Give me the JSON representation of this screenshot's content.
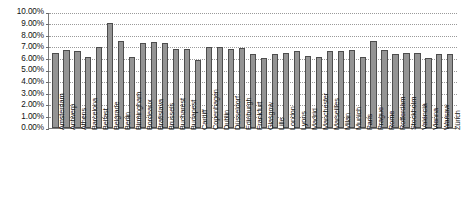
{
  "chart_data": {
    "type": "bar",
    "title": "",
    "subtitle": "",
    "xlabel": "",
    "ylabel": "",
    "ylim": [
      0,
      10
    ],
    "y_unit": "%",
    "grid": true,
    "legend": "none",
    "y_ticks": [
      "0.00%",
      "1.00%",
      "2.00%",
      "3.00%",
      "4.00%",
      "5.00%",
      "6.00%",
      "7.00%",
      "8.00%",
      "9.00%",
      "10.00%"
    ],
    "y_tick_values": [
      0,
      1,
      2,
      3,
      4,
      5,
      6,
      7,
      8,
      9,
      10
    ],
    "categories": [
      "Amsterdam",
      "Antwerp",
      "Athens",
      "Barcelona",
      "Belfast",
      "Belgrade",
      "Berlin",
      "Birmingham",
      "Bordeaux",
      "Bratislava",
      "Brussels",
      "Bucharest",
      "Budapest",
      "Cardiff",
      "Copenhagen",
      "Dublin",
      "Düsseldorf",
      "Edinburgh",
      "Frankfurt",
      "Glasgow",
      "Lille",
      "London",
      "Lyons",
      "Madrid",
      "Manchester",
      "Marseilles",
      "Milan",
      "Munich",
      "Paris",
      "Prague",
      "Rome",
      "Rotterdam",
      "Stockholm",
      "Valencia",
      "Vienna",
      "Warsaw",
      "Zürich"
    ],
    "values": [
      6.45,
      6.7,
      6.6,
      6.1,
      6.95,
      9.0,
      7.5,
      6.1,
      7.3,
      7.4,
      7.3,
      6.8,
      6.75,
      5.85,
      6.95,
      6.95,
      6.8,
      6.85,
      6.3,
      6.0,
      6.35,
      6.4,
      6.6,
      6.2,
      6.1,
      6.6,
      6.6,
      6.7,
      6.1,
      7.45,
      6.7,
      6.3,
      6.4,
      6.4,
      5.95,
      6.3,
      6.3
    ],
    "series": [
      {
        "name": "Yield",
        "values": [
          6.45,
          6.7,
          6.6,
          6.1,
          6.95,
          9.0,
          7.5,
          6.1,
          7.3,
          7.4,
          7.3,
          6.8,
          6.75,
          5.85,
          6.95,
          6.95,
          6.8,
          6.85,
          6.3,
          6.0,
          6.35,
          6.4,
          6.6,
          6.2,
          6.1,
          6.6,
          6.6,
          6.7,
          6.1,
          7.45,
          6.7,
          6.3,
          6.4,
          6.4,
          5.95,
          6.3,
          6.3
        ]
      }
    ],
    "colors": {
      "bar_fill": "#949494",
      "bar_border": "#4d4d4d",
      "gridline": "#9a9a9a",
      "axis": "#7a7a7a",
      "text": "#111111",
      "background": "#ffffff"
    }
  }
}
